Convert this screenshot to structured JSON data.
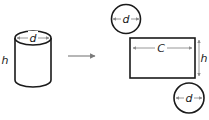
{
  "colors": {
    "stroke": "#1a1a1a",
    "dimension": "#8c8c8c",
    "label": "#1a1a1a",
    "arrow": "#7a7a7a",
    "background": "#ffffff"
  },
  "cylinder": {
    "diameter_label": "d",
    "height_label": "h"
  },
  "transform_arrow": {
    "icon": "right-arrow"
  },
  "net": {
    "top_circle": {
      "diameter_label": "d"
    },
    "rectangle": {
      "width_label": "C",
      "height_label": "h"
    },
    "bottom_circle": {
      "diameter_label": "d"
    }
  }
}
